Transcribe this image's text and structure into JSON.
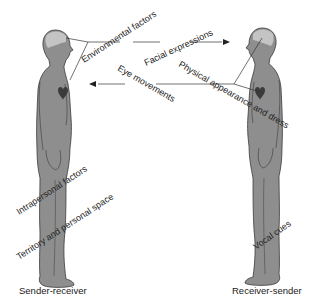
{
  "diagram": {
    "type": "nonverbal-communication",
    "colors": {
      "body": "#8e8e8e",
      "head_highlight": "#c4c4c4",
      "outline": "#3a3a3a",
      "heart": "#3b3b3b",
      "line": "#333333",
      "text": "#222222"
    },
    "figures": [
      {
        "id": "left",
        "caption": "Sender-receiver"
      },
      {
        "id": "right",
        "caption": "Receiver-sender"
      }
    ],
    "labels": {
      "environmental": "Environmental factors",
      "facial": "Facial expressions",
      "eye": "Eye movements",
      "physical": "Physical appearance and dress",
      "intrapersonal": "Intrapersonal factors",
      "territory": "Territory and personal space",
      "vocal": "Vocal cues"
    },
    "arrows": [
      {
        "from": "left",
        "to": "right",
        "label": "Facial expressions"
      },
      {
        "from": "right",
        "to": "left",
        "label": "Eye movements"
      }
    ]
  }
}
